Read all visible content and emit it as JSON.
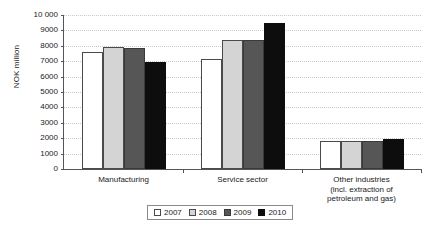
{
  "chart_data": {
    "type": "bar",
    "title": "",
    "xlabel": "",
    "ylabel": "NOK million",
    "ylim": [
      0,
      10000
    ],
    "ytick_step": 1000,
    "ytick_labels": [
      "0",
      "1000",
      "2000",
      "3000",
      "4000",
      "5000",
      "6000",
      "7000",
      "8000",
      "9000",
      "10 000"
    ],
    "grid": true,
    "legend_position": "bottom-center",
    "categories": [
      "Manufacturing",
      "Service sector",
      "Other industries (incl. extraction of petroleum and gas)"
    ],
    "category_label_lines": [
      [
        "Manufacturing"
      ],
      [
        "Service sector"
      ],
      [
        "Other industries",
        "(incl. extraction of",
        "petroleum and gas)"
      ]
    ],
    "series": [
      {
        "name": "2007",
        "color": "#ffffff",
        "values": [
          7600,
          7150,
          1830
        ]
      },
      {
        "name": "2008",
        "color": "#d4d4d4",
        "values": [
          7900,
          8400,
          1850
        ]
      },
      {
        "name": "2009",
        "color": "#565656",
        "values": [
          7850,
          8400,
          1800
        ]
      },
      {
        "name": "2010",
        "color": "#0d0d0d",
        "values": [
          6950,
          9450,
          1950
        ]
      }
    ]
  },
  "legend": {
    "items": [
      {
        "label": "2007",
        "swatch": "legend-swatch-2007"
      },
      {
        "label": "2008",
        "swatch": "legend-swatch-2008"
      },
      {
        "label": "2009",
        "swatch": "legend-swatch-2009"
      },
      {
        "label": "2010",
        "swatch": "legend-swatch-2010"
      }
    ]
  }
}
